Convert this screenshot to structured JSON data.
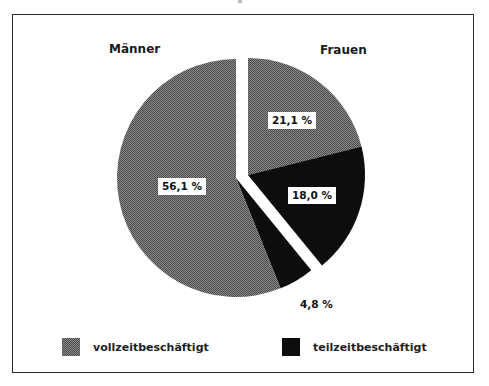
{
  "chart_data": {
    "type": "pie",
    "title": "",
    "groups": [
      {
        "name": "Männer",
        "total": 60.9
      },
      {
        "name": "Frauen",
        "total": 39.1
      }
    ],
    "slices": [
      {
        "group": "Frauen",
        "category": "vollzeitbeschäftigt",
        "value": 21.1,
        "label": "21,1 %"
      },
      {
        "group": "Frauen",
        "category": "teilzeitbeschäftigt",
        "value": 18.0,
        "label": "18,0 %"
      },
      {
        "group": "Männer",
        "category": "teilzeitbeschäftigt",
        "value": 4.8,
        "label": "4,8 %"
      },
      {
        "group": "Männer",
        "category": "vollzeitbeschäftigt",
        "value": 56.1,
        "label": "56,1 %"
      }
    ],
    "legend": [
      {
        "label": "vollzeitbeschäftigt",
        "color": "#6e6e6e",
        "pattern": "dither-gray"
      },
      {
        "label": "teilzeitbeschäftigt",
        "color": "#0d0d0d",
        "pattern": "solid-black"
      }
    ],
    "legend_position": "bottom",
    "exploded_group": "Frauen",
    "units": "%"
  },
  "labels": {
    "men": "Männer",
    "women": "Frauen",
    "women_full": "21,1 %",
    "women_part": "18,0 %",
    "men_part": "4,8 %",
    "men_full": "56,1 %"
  },
  "legend": {
    "full": "vollzeitbeschäftigt",
    "part": "teilzeitbeschäftigt"
  },
  "colors": {
    "full_time": "#6e6e6e",
    "part_time": "#0d0d0d",
    "frame": "#2a2a2a"
  }
}
